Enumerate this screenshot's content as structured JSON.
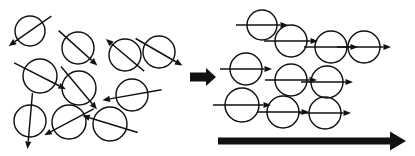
{
  "figure": {
    "title": "Magnetic domain alignment under an applied field",
    "width": 415,
    "height": 156,
    "background_color": "#ffffff",
    "stroke_color": "#111111"
  },
  "chart_data": {
    "type": "diagram",
    "title": "Magnetic domain alignment under an applied field",
    "panels": [
      {
        "name": "disordered",
        "label": "Randomly oriented domains",
        "circle_count": 10,
        "arrow_orientation": "random",
        "domains": [
          {
            "id": "d1",
            "cx": 30,
            "cy": 31,
            "r": 15,
            "angle_deg": 215,
            "arrow_length": 52
          },
          {
            "id": "d2",
            "cx": 78,
            "cy": 48,
            "r": 16,
            "angle_deg": 318,
            "arrow_length": 52
          },
          {
            "id": "d3",
            "cx": 125,
            "cy": 55,
            "r": 16,
            "angle_deg": 140,
            "arrow_length": 50
          },
          {
            "id": "d4",
            "cx": 159,
            "cy": 52,
            "r": 16,
            "angle_deg": 330,
            "arrow_length": 54
          },
          {
            "id": "d5",
            "cx": 40,
            "cy": 76,
            "r": 17,
            "angle_deg": 333,
            "arrow_length": 58
          },
          {
            "id": "d6",
            "cx": 79,
            "cy": 88,
            "r": 17,
            "angle_deg": 310,
            "arrow_length": 56
          },
          {
            "id": "d7",
            "cx": 132,
            "cy": 95,
            "r": 16,
            "angle_deg": 190,
            "arrow_length": 60
          },
          {
            "id": "d8",
            "cx": 30,
            "cy": 121,
            "r": 16,
            "angle_deg": 265,
            "arrow_length": 56
          },
          {
            "id": "d9",
            "cx": 69,
            "cy": 122,
            "r": 17,
            "angle_deg": 208,
            "arrow_length": 56
          },
          {
            "id": "d10",
            "cx": 110,
            "cy": 124,
            "r": 17,
            "angle_deg": 163,
            "arrow_length": 58
          }
        ]
      },
      {
        "name": "ordered",
        "label": "Aligned domains",
        "circle_count": 10,
        "arrow_orientation": "all pointing right (0 degrees)",
        "rows": [
          {
            "row": 1,
            "domains": [
              {
                "id": "o1",
                "cx": 262,
                "cy": 25,
                "r": 15,
                "angle_deg": 0,
                "arrow_length": 52
              },
              {
                "id": "o2",
                "cx": 291,
                "cy": 41,
                "r": 16,
                "angle_deg": 0,
                "arrow_length": 54
              },
              {
                "id": "o3",
                "cx": 331,
                "cy": 47,
                "r": 16,
                "angle_deg": 0,
                "arrow_length": 54
              },
              {
                "id": "o4",
                "cx": 364,
                "cy": 47,
                "r": 16,
                "angle_deg": 0,
                "arrow_length": 54
              }
            ]
          },
          {
            "row": 2,
            "domains": [
              {
                "id": "o5",
                "cx": 246,
                "cy": 69,
                "r": 16,
                "angle_deg": 0,
                "arrow_length": 52
              },
              {
                "id": "o6",
                "cx": 291,
                "cy": 80,
                "r": 16,
                "angle_deg": 0,
                "arrow_length": 52
              },
              {
                "id": "o7",
                "cx": 327,
                "cy": 82,
                "r": 16,
                "angle_deg": 0,
                "arrow_length": 52
              }
            ]
          },
          {
            "row": 3,
            "domains": [
              {
                "id": "o8",
                "cx": 242,
                "cy": 105,
                "r": 17,
                "angle_deg": 0,
                "arrow_length": 58
              },
              {
                "id": "o9",
                "cx": 283,
                "cy": 112,
                "r": 16,
                "angle_deg": 0,
                "arrow_length": 52
              },
              {
                "id": "o10",
                "cx": 325,
                "cy": 113,
                "r": 16,
                "angle_deg": 0,
                "arrow_length": 52
              }
            ]
          }
        ]
      }
    ],
    "transition_arrow": {
      "name": "transition-arrow",
      "label": "transforms into",
      "x_start": 190,
      "x_end": 216,
      "y": 77,
      "thickness": 9,
      "direction": "right",
      "color": "#111111"
    },
    "field_arrow": {
      "name": "applied-field-arrow",
      "label": "applied magnetic field direction",
      "x_start": 218,
      "x_end": 406,
      "y": 141,
      "thickness": 7,
      "direction": "right",
      "color": "#111111"
    }
  }
}
